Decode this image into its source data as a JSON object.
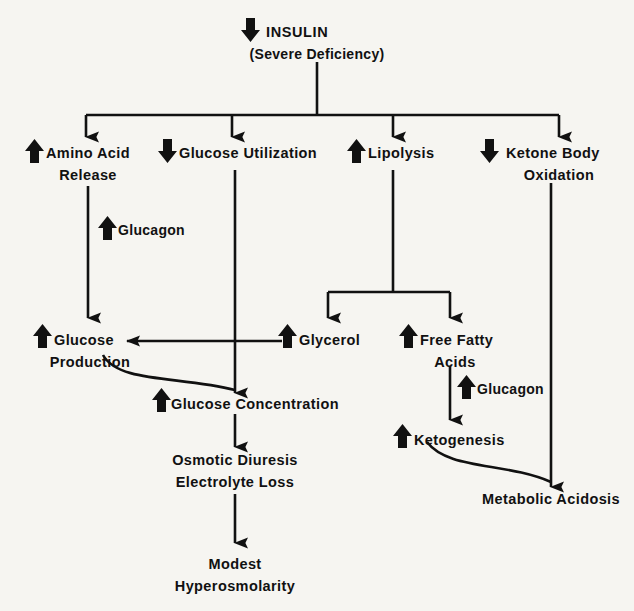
{
  "figure": {
    "background_color": "#f6f5f1",
    "ink_color": "#111111",
    "type": "flowchart"
  },
  "nodes": {
    "root": {
      "line1": "INSULIN",
      "line2": "(Severe Deficiency)",
      "direction": "down"
    },
    "amino_acid_release": {
      "line1": "Amino Acid",
      "line2": "Release",
      "direction": "up"
    },
    "glucose_utilization": {
      "line1": "Glucose Utilization",
      "line2": "",
      "direction": "down"
    },
    "lipolysis": {
      "line1": "Lipolysis",
      "line2": "",
      "direction": "up"
    },
    "ketone_body_oxidation": {
      "line1": "Ketone Body",
      "line2": "Oxidation",
      "direction": "down"
    },
    "glucose_production": {
      "line1": "Glucose",
      "line2": "Production",
      "direction": "up"
    },
    "glycerol": {
      "line1": "Glycerol",
      "line2": "",
      "direction": "up"
    },
    "free_fatty_acids": {
      "line1": "Free Fatty",
      "line2": "Acids",
      "direction": "up"
    },
    "glucose_concentration": {
      "line1": "Glucose Concentration",
      "line2": "",
      "direction": "up"
    },
    "ketogenesis": {
      "line1": "Ketogenesis",
      "line2": "",
      "direction": "up"
    },
    "osmotic_diuresis": {
      "line1": "Osmotic Diuresis",
      "line2": "Electrolyte Loss",
      "direction": "none"
    },
    "metabolic_acidosis": {
      "line1": "Metabolic Acidosis",
      "line2": "",
      "direction": "none"
    },
    "modest_hyperosmolarity": {
      "line1": "Modest",
      "line2": "Hyperosmolarity",
      "direction": "none"
    }
  },
  "modifiers": {
    "glucagon_left": {
      "label": "Glucagon",
      "direction": "up"
    },
    "glucagon_right": {
      "label": "Glucagon",
      "direction": "up"
    }
  }
}
